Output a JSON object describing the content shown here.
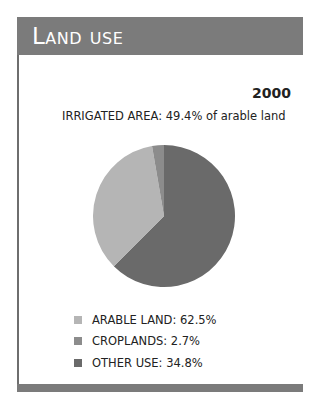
{
  "header": {
    "title": "Land use"
  },
  "year": "2000",
  "subtitle": "IRRIGATED AREA: 49.4% of arable land",
  "legend": [
    {
      "label": "ARABLE LAND: 62.5%",
      "color": "#b5b5b5"
    },
    {
      "label": "CROPLANDS: 2.7%",
      "color": "#8c8c8c"
    },
    {
      "label": "OTHER USE: 34.8%",
      "color": "#6a6a6a"
    }
  ],
  "colors": {
    "header_bg": "#7b7b7b",
    "arable": "#b5b5b5",
    "croplands": "#8c8c8c",
    "other": "#6a6a6a"
  },
  "chart_data": {
    "type": "pie",
    "title": "Land use",
    "subtitle": "IRRIGATED AREA: 49.4% of arable land",
    "annotation": "2000",
    "categories": [
      "ARABLE LAND",
      "CROPLANDS",
      "OTHER USE"
    ],
    "values": [
      62.5,
      2.7,
      34.8
    ],
    "unit": "%",
    "legend_position": "bottom-left",
    "note": "Rendered slice sizes in the figure visually show the dark slice as largest (~62.5%) and the light slice ~34.8%; legend text maps light=ARABLE 62.5%, medium=CROPLANDS 2.7%, dark=OTHER USE 34.8%."
  }
}
